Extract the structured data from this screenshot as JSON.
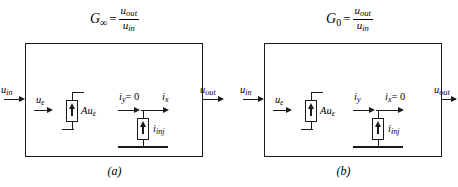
{
  "figure": {
    "type": "circuit-diagram",
    "line_color": "#1a1a1a",
    "background": "#ffffff"
  },
  "panels": [
    {
      "id": "a",
      "caption": "(a)",
      "formula": {
        "lhs": "G",
        "lhs_subscript": "∞",
        "equals": "=",
        "numerator": "u",
        "numerator_sub": "out",
        "denominator": "u",
        "denominator_sub": "in"
      },
      "ports": {
        "input_label": "u",
        "input_sub": "in",
        "output_label": "u",
        "output_sub": "out"
      },
      "inner": {
        "error_label": "u",
        "error_sub": "ε",
        "source_label": "Au",
        "source_sub": "ε",
        "current_y": "i",
        "current_y_sub": "y",
        "current_y_value": "= 0",
        "current_x": "i",
        "current_x_sub": "x",
        "current_x_value": "",
        "inject_label": "i",
        "inject_sub": "inj"
      }
    },
    {
      "id": "b",
      "caption": "(b)",
      "formula": {
        "lhs": "G",
        "lhs_subscript": "0",
        "equals": "=",
        "numerator": "u",
        "numerator_sub": "out",
        "denominator": "u",
        "denominator_sub": "in"
      },
      "ports": {
        "input_label": "u",
        "input_sub": "in",
        "output_label": "u",
        "output_sub": "out"
      },
      "inner": {
        "error_label": "u",
        "error_sub": "ε",
        "source_label": "Au",
        "source_sub": "ε",
        "current_y": "i",
        "current_y_sub": "y",
        "current_y_value": "",
        "current_x": "i",
        "current_x_sub": "x",
        "current_x_value": "= 0",
        "inject_label": "i",
        "inject_sub": "inj"
      }
    }
  ]
}
